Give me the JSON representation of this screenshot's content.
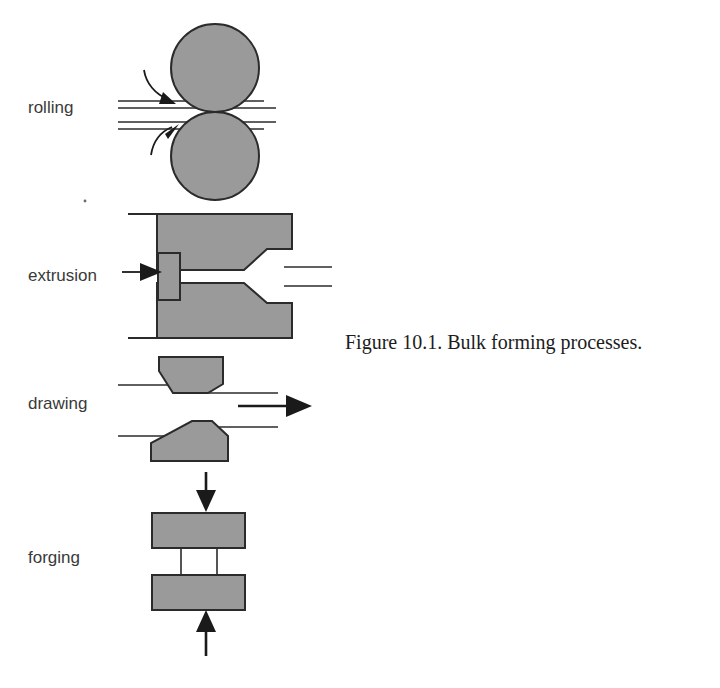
{
  "figure": {
    "caption": "Figure 10.1.  Bulk forming processes.",
    "caption_x": 345,
    "caption_y": 349
  },
  "style": {
    "part_fill": "#9a9a9a",
    "part_stroke": "#2b2b2b",
    "line_color": "#2b2b2b",
    "background": "#ffffff",
    "label_color": "#3a3a3a",
    "caption_color": "#1c1c1c"
  },
  "processes": [
    {
      "key": "rolling",
      "label": "rolling",
      "label_x": 28,
      "label_y": 113,
      "parts": {
        "top_roll": {
          "cx": 215,
          "cy": 68,
          "r": 44
        },
        "bottom_roll": {
          "cx": 215,
          "cy": 155,
          "r": 44
        },
        "upper_strip_top": "M118,101 L264,101",
        "upper_strip_bottom": "M118,108 L274,108",
        "lower_strip_top": "M118,122 L274,122",
        "lower_strip_bottom": "M118,129 L264,129",
        "top_arrow": "M143,72 C147,85 156,95 170,101",
        "bottom_arrow": "M150,152 C154,139 161,131 172,126"
      }
    },
    {
      "key": "extrusion",
      "label": "extrusion",
      "label_x": 28,
      "label_y": 281,
      "parts": {
        "upper_die": "M128,214 L292,214 L292,250 L268,272 L243,272 L243,254 L157,254 L157,214 Z",
        "lower_die": "M128,338 L292,338 L292,301 L268,280 L243,280 L243,297 L157,297 L157,338 Z",
        "ram": "M157,238 L180,238 L180,313 L157,313 Z",
        "product_upper": "M292,268 L330,268",
        "product_lower": "M292,285 L330,285",
        "pointer_line": "M122,271 L158,271",
        "pointer_head": "M138,263 L160,271 L138,279 Z"
      }
    },
    {
      "key": "drawing",
      "label": "drawing",
      "label_x": 28,
      "label_y": 409,
      "parts": {
        "upper_die": "M157,357 L220,357 L220,384 L205,392 L173,392 L157,372 Z",
        "lower_die": "M152,460 L226,460 L226,437 L212,425 L190,425 L152,445 Z",
        "wire_in_upper": "M118,384 L205,384",
        "wire_out_upper": "M205,392 L275,392",
        "wire_in_lower": "M118,434 L212,434",
        "wire_out_lower": "M212,425 L275,425",
        "pull_line": "M240,405 L295,405",
        "pull_head": "M288,394 L312,405 L288,416 Z",
        "stem": "M208,470 L208,498",
        "stem_head": "M198,490 L208,512 L218,490 Z"
      }
    },
    {
      "key": "forging",
      "label": "forging",
      "label_x": 28,
      "label_y": 563,
      "parts": {
        "top_platen": {
          "x": 152,
          "y": 512,
          "w": 92,
          "h": 34
        },
        "bottom_platen": {
          "x": 152,
          "y": 574,
          "w": 92,
          "h": 34
        },
        "workpiece_left": "M180,546 L180,574",
        "workpiece_right": "M216,546 L216,574",
        "top_arrow_line": "M198,470 L198,500",
        "top_arrow_head": "M188,492 L198,512 L208,492 Z",
        "bottom_arrow_line": "M198,652 L198,620",
        "bottom_arrow_head": "M188,628 L198,608 L208,628 Z"
      }
    }
  ]
}
